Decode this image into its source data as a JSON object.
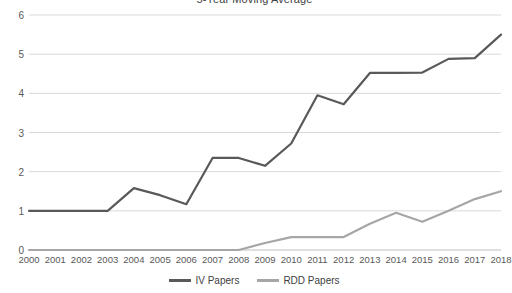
{
  "chart_data": {
    "type": "line",
    "title": "5-Year Moving Average",
    "xlabel": "",
    "ylabel": "",
    "ylim": [
      0,
      6
    ],
    "yticks": [
      0,
      1,
      2,
      3,
      4,
      5,
      6
    ],
    "grid": true,
    "legend_position": "bottom",
    "categories": [
      "2000",
      "2001",
      "2002",
      "2003",
      "2004",
      "2005",
      "2006",
      "2007",
      "2008",
      "2009",
      "2010",
      "2011",
      "2012",
      "2013",
      "2014",
      "2015",
      "2016",
      "2017",
      "2018"
    ],
    "series": [
      {
        "name": "IV Papers",
        "color": "#595959",
        "values": [
          1.0,
          1.0,
          1.0,
          1.0,
          1.58,
          1.4,
          1.17,
          2.35,
          2.35,
          2.15,
          2.72,
          3.95,
          3.72,
          4.52,
          4.52,
          4.53,
          4.88,
          4.9,
          5.5
        ]
      },
      {
        "name": "RDD Papers",
        "color": "#a6a6a6",
        "values": [
          0.0,
          0.0,
          0.0,
          0.0,
          0.0,
          0.0,
          0.0,
          0.0,
          0.0,
          0.18,
          0.33,
          0.33,
          0.33,
          0.67,
          0.95,
          0.72,
          1.0,
          1.3,
          1.5
        ]
      }
    ]
  }
}
